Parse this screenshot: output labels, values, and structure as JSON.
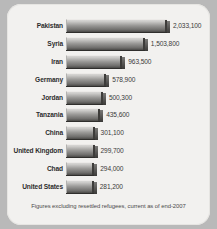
{
  "chart_data": {
    "type": "bar",
    "title": "",
    "xlabel": "",
    "ylabel": "",
    "orientation": "horizontal",
    "grid": false,
    "legend": null,
    "xlim": [
      0,
      2033100
    ],
    "categories": [
      "Pakistan",
      "Syria",
      "Iran",
      "Germany",
      "Jordan",
      "Tanzania",
      "China",
      "United Kingdom",
      "Chad",
      "United States"
    ],
    "values": [
      2033100,
      1503800,
      963500,
      578900,
      500300,
      435600,
      301100,
      299700,
      294000,
      281200
    ],
    "value_labels": [
      "2,033,100",
      "1,503,800",
      "963,500",
      "578,900",
      "500,300",
      "435,600",
      "301,100",
      "299,700",
      "294,000",
      "281,200"
    ],
    "annotation": "Figures excluding resettled refugees, current as of end-2007"
  },
  "footnote": "Figures excluding resettled refugees, current as of end-2007",
  "colors": {
    "panel_background": "#f2f1ef",
    "outer_background": "#b9b9b9",
    "bar_light": "#d7d6d4",
    "bar_dark": "#4a4947",
    "label_text": "#2c2c2c",
    "value_text": "#3a3a3a"
  }
}
